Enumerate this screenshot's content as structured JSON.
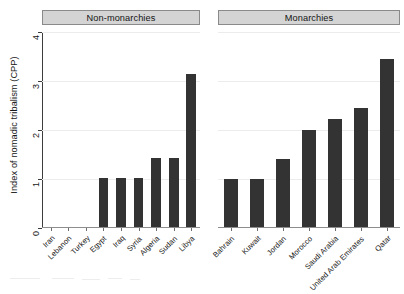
{
  "chart_data": {
    "type": "bar",
    "title": "",
    "xlabel": "",
    "ylabel": "Index of nomadic tribalism (CPP)",
    "ylim": [
      0,
      4
    ],
    "yticks": [
      0,
      1,
      2,
      3,
      4
    ],
    "ytick_labels": [
      "0",
      "1",
      "2",
      "3",
      "4"
    ],
    "grid": true,
    "legend": "none",
    "panels": [
      {
        "name": "Non-monarchies",
        "categories": [
          "Iran",
          "Lebanon",
          "Turkey",
          "Egypt",
          "Iraq",
          "Syria",
          "Algeria",
          "Sudan",
          "Libya"
        ],
        "values": [
          0,
          0,
          0,
          1.0,
          1.0,
          1.0,
          1.4,
          1.4,
          3.13
        ]
      },
      {
        "name": "Monarchies",
        "categories": [
          "Bahrain",
          "Kuwait",
          "Jordan",
          "Morocco",
          "Saudi Arabia",
          "United Arab Emirates",
          "Qatar"
        ],
        "values": [
          0.98,
          0.98,
          1.38,
          1.97,
          2.2,
          2.42,
          3.42
        ]
      }
    ],
    "colors": {
      "bar": "#333333",
      "panel_header_background": "#d4d4d4",
      "panel_header_border": "#8a8a8a",
      "gridline": "#ececed",
      "axis": "#3d3d3d",
      "background": "#ffffff"
    }
  }
}
